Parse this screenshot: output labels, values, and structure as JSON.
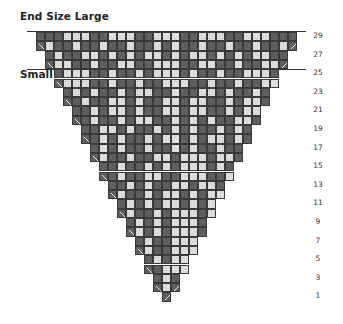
{
  "title": "End Size Large",
  "small_label": "Small",
  "colors": {
    "dark": "#5f5f5f",
    "light": "#dcdcdc",
    "grid": "#3a3a3a",
    "text": "#222222"
  },
  "legend_symbols": {
    "left_decrease": "ssk-icon",
    "right_decrease": "k2tog-icon"
  },
  "row_labels": [
    "29",
    "27",
    "25",
    "23",
    "21",
    "19",
    "17",
    "15",
    "13",
    "11",
    "9",
    "7",
    "5",
    "3",
    "1"
  ],
  "rows": [
    {
      "row": 29,
      "cells": "DDDLLLDDLLLDDLLLDDLLLDDLLLDDD"
    },
    {
      "row": 28,
      "cells": "\\LDDLDDLDDLDDLDLDDLDDLDDLDDL/"
    },
    {
      "row": 27,
      "cells": "DLDDLLDLDLDLLDLDLLDLDLDLLDDLD"
    },
    {
      "row": 26,
      "cells": "\\LLDDLDDLLDDLLLDDLLDDLDDLL/"
    },
    {
      "row": 25,
      "cells": "DLLLDDLDDLDLLLDLDDLDDLLLD"
    },
    {
      "row": 24,
      "cells": "\\LLLDDLDDLDDLLLDDLDDLDDLLL/"
    },
    {
      "row": 23,
      "cells": "DLDLDDLDLLDDLDDLLDLDDLDLD"
    },
    {
      "row": 22,
      "cells": "\\DLDDLLDLDDLLDLLDDLDLLDDLD/"
    },
    {
      "row": 21,
      "cells": "DDLDLLDLDDLLDLLDDLDLLDLDD"
    },
    {
      "row": 20,
      "cells": "\\DLDDLDLLDDLDLDLDDLLDLDDLD/"
    },
    {
      "row": 19,
      "cells": "DDLLDLDDLDLDLDDLDLDDLDLLDD"
    },
    {
      "row": 18,
      "cells": "\\DLDLDDLDLLDLDLLDLDDLDLD/"
    },
    {
      "row": 17,
      "cells": "DLDLDDLDDLDLDDLDDLDLD"
    },
    {
      "row": 16,
      "cells": "\\LDDLDDLLDLLLDLLDDLDDL/"
    },
    {
      "row": 15,
      "cells": "DDLDDLDLDLLLDLDLDDLDD"
    },
    {
      "row": 14,
      "cells": "\\DLDDLLDDLLLDDLLDDLD/"
    },
    {
      "row": 13,
      "cells": "DDLDLDDLLDLLDDLDLDD"
    },
    {
      "row": 12,
      "cells": "\\LDDLDLLDLDLLDLDDL/"
    },
    {
      "row": 11,
      "cells": "DLDLDLLDLDLLDLDLD"
    },
    {
      "row": 10,
      "cells": "\\LDDLDLLLDLDDL/"
    },
    {
      "row": 9,
      "cells": "DLDLDLLLDLDLD"
    },
    {
      "row": 8,
      "cells": "\\LDLDLLLDLDL/"
    },
    {
      "row": 7,
      "cells": "DLDDLLLDDLD"
    },
    {
      "row": 6,
      "cells": "\\LDDLLLDDL/"
    },
    {
      "row": 5,
      "cells": "DLDLLLDLD"
    },
    {
      "row": 4,
      "cells": "\\DLLLD/"
    },
    {
      "row": 3,
      "cells": "DLDLLDL"
    },
    {
      "row": 2,
      "cells": "\\L/"
    },
    {
      "row": 1,
      "cells": "/"
    }
  ]
}
